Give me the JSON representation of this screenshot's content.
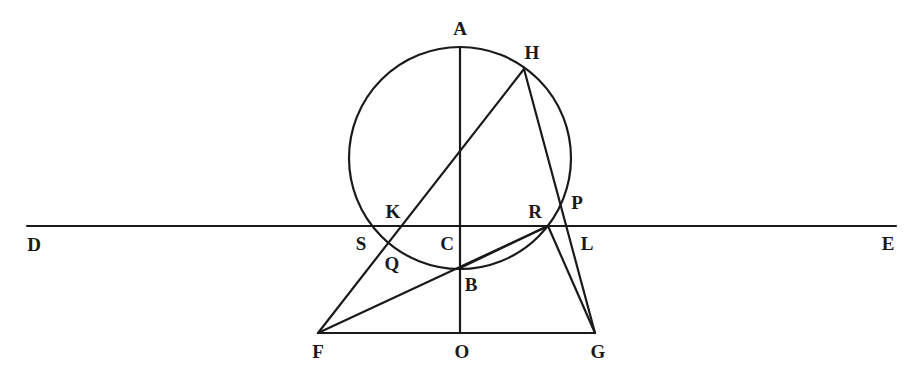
{
  "diagram": {
    "type": "geometric construction",
    "circle": {
      "cx": 460,
      "cy": 158,
      "r": 111
    },
    "points": {
      "A": [
        460,
        47
      ],
      "H": [
        524,
        69
      ],
      "K": [
        397,
        226
      ],
      "S": [
        374,
        226
      ],
      "Q": [
        387,
        243
      ],
      "C": [
        460,
        226
      ],
      "B": [
        460,
        268
      ],
      "R": [
        548,
        226
      ],
      "P": [
        563,
        203
      ],
      "L": [
        572,
        226
      ],
      "D": [
        27,
        226
      ],
      "E": [
        896,
        226
      ],
      "F": [
        318,
        333
      ],
      "O": [
        460,
        333
      ],
      "G": [
        595,
        333
      ]
    },
    "segments": [
      {
        "name": "line-DE",
        "from": "D",
        "to": "E"
      },
      {
        "name": "line-AO",
        "from": "A",
        "to": "O"
      },
      {
        "name": "line-FG",
        "from": "F",
        "to": "G"
      },
      {
        "name": "line-FH",
        "from": "F",
        "to": "H"
      },
      {
        "name": "line-HG",
        "from": "H",
        "to": "G"
      },
      {
        "name": "line-FR",
        "from": "F",
        "to": "R"
      },
      {
        "name": "line-RG",
        "from": "R",
        "to": "G"
      },
      {
        "name": "line-BR",
        "from": "B",
        "to": "R"
      }
    ],
    "labels": [
      {
        "text": "A",
        "x": 460,
        "y": 31
      },
      {
        "text": "H",
        "x": 532,
        "y": 55
      },
      {
        "text": "K",
        "x": 393,
        "y": 214
      },
      {
        "text": "R",
        "x": 535,
        "y": 214
      },
      {
        "text": "P",
        "x": 577,
        "y": 205
      },
      {
        "text": "D",
        "x": 34,
        "y": 247
      },
      {
        "text": "S",
        "x": 361,
        "y": 246
      },
      {
        "text": "C",
        "x": 447,
        "y": 246
      },
      {
        "text": "L",
        "x": 587,
        "y": 246
      },
      {
        "text": "E",
        "x": 888,
        "y": 246
      },
      {
        "text": "Q",
        "x": 392,
        "y": 266
      },
      {
        "text": "B",
        "x": 471,
        "y": 287
      },
      {
        "text": "F",
        "x": 318,
        "y": 354
      },
      {
        "text": "O",
        "x": 462,
        "y": 354
      },
      {
        "text": "G",
        "x": 598,
        "y": 354
      }
    ]
  }
}
